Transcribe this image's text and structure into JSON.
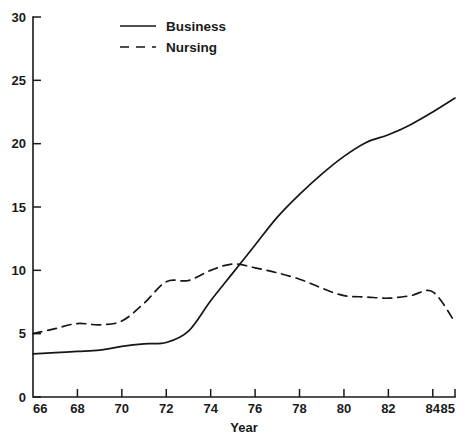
{
  "chart_data": {
    "type": "line",
    "title": "",
    "xlabel": "Year",
    "ylabel": "",
    "xlim": [
      66,
      85
    ],
    "ylim": [
      0,
      30
    ],
    "grid": false,
    "legend_position": "top-center",
    "x_ticks": [
      "66",
      "68",
      "70",
      "72",
      "74",
      "76",
      "78",
      "80",
      "82",
      "84",
      "85"
    ],
    "x_tick_values": [
      66,
      68,
      70,
      72,
      74,
      76,
      78,
      80,
      82,
      84,
      85
    ],
    "y_ticks": [
      "0",
      "5",
      "10",
      "15",
      "20",
      "25",
      "30"
    ],
    "y_tick_values": [
      0,
      5,
      10,
      15,
      20,
      25,
      30
    ],
    "x": [
      66,
      67,
      68,
      69,
      70,
      71,
      72,
      73,
      74,
      75,
      76,
      77,
      78,
      79,
      80,
      81,
      82,
      83,
      84,
      85
    ],
    "series": [
      {
        "name": "Business",
        "style": "solid",
        "values": [
          3.4,
          3.5,
          3.6,
          3.7,
          4.0,
          4.2,
          4.3,
          5.2,
          7.6,
          9.8,
          12.0,
          14.2,
          16.0,
          17.6,
          19.0,
          20.1,
          20.7,
          21.5,
          22.5,
          23.6
        ]
      },
      {
        "name": "Nursing",
        "style": "dashed",
        "values": [
          5.0,
          5.4,
          5.8,
          5.7,
          6.0,
          7.4,
          9.1,
          9.2,
          10.0,
          10.5,
          10.2,
          9.8,
          9.3,
          8.6,
          8.0,
          7.9,
          7.8,
          8.0,
          8.3,
          5.9
        ]
      }
    ],
    "annotations": {
      "crossover_note": "Business overtakes Nursing near year 75"
    }
  },
  "legend": {
    "entries": [
      {
        "label": "Business",
        "style": "solid"
      },
      {
        "label": "Nursing",
        "style": "dashed"
      }
    ]
  },
  "axes": {
    "x_title": "Year"
  },
  "colors": {
    "line": "#161616",
    "text": "#1a1a1a",
    "background": "#ffffff"
  }
}
